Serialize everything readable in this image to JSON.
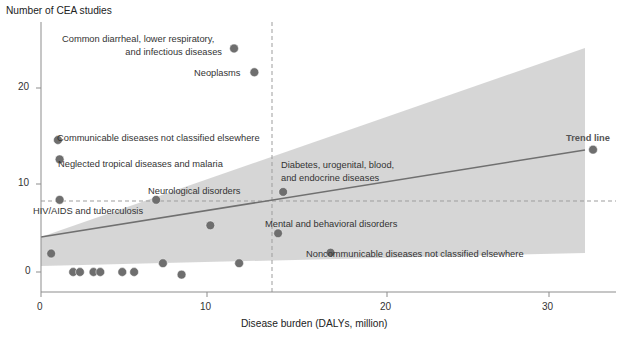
{
  "chart_data": {
    "type": "scatter",
    "title": "",
    "xlabel": "Disease burden (DALYs, million)",
    "ylabel": "Number of CEA studies",
    "xlim": [
      0,
      32.5
    ],
    "ylim": [
      -1.5,
      26.5
    ],
    "xticks": [
      0,
      10,
      20,
      30
    ],
    "yticks": [
      0,
      10,
      20
    ],
    "xtick_labels": [
      "0",
      "10",
      "20",
      "30"
    ],
    "ytick_labels": [
      "0",
      "10",
      "20"
    ],
    "grid": false,
    "legend": "none",
    "marker_color": "#6e6e6e",
    "band_color": "#d3d3d3",
    "trendline_color": "#6e6e6e",
    "reference_lines": {
      "vertical_x": 14.0,
      "horizontal_y": 8.1,
      "style": "dashed",
      "color": "#9a9a9a"
    },
    "trend_line": {
      "label": "Trend line",
      "x": [
        0.0,
        32.7
      ],
      "y": [
        4.0,
        13.9
      ],
      "band_label": "confidence band",
      "band_upper": [
        7.0,
        25.3
      ],
      "band_lower": [
        0.6,
        2.2
      ]
    },
    "points": [
      {
        "label": "Common diarrheal, lower respiratory, and infectious diseases",
        "x": 11.4,
        "y": 25.4,
        "label_pos": "left"
      },
      {
        "label": "Neoplasms",
        "x": 12.6,
        "y": 22.7,
        "label_pos": "left"
      },
      {
        "label": "Communicable diseases not classified elsewhere",
        "x": 1.0,
        "y": 15.0,
        "label_pos": "right"
      },
      {
        "label": "Neglected tropical diseases and malaria",
        "x": 1.1,
        "y": 12.8,
        "label_pos": "right"
      },
      {
        "label": "HIV/AIDS and tuberculosis",
        "x": 1.1,
        "y": 8.2,
        "label_pos": "below"
      },
      {
        "label": "Neurological disorders",
        "x": 6.8,
        "y": 8.2,
        "label_pos": "above"
      },
      {
        "label": "Diabetes, urogenital, blood, and endocrine diseases",
        "x": 14.3,
        "y": 9.1,
        "label_pos": "above"
      },
      {
        "label": "Mental and behavioral disorders",
        "x": 14.0,
        "y": 4.4,
        "label_pos": "above"
      },
      {
        "label": "Noncommunicable diseases not classified elsewhere",
        "x": 17.1,
        "y": 2.2,
        "label_pos": "right"
      },
      {
        "label": "Trend line",
        "x": 32.6,
        "y": 13.9,
        "label_pos": "above"
      },
      {
        "label": "",
        "x": 10.0,
        "y": 5.3,
        "label_pos": "none"
      },
      {
        "label": "",
        "x": 0.6,
        "y": 2.1,
        "label_pos": "none"
      },
      {
        "label": "",
        "x": 7.2,
        "y": 1.0,
        "label_pos": "none"
      },
      {
        "label": "",
        "x": 11.7,
        "y": 1.0,
        "label_pos": "none"
      },
      {
        "label": "",
        "x": 1.9,
        "y": 0.0,
        "label_pos": "none"
      },
      {
        "label": "",
        "x": 2.3,
        "y": 0.0,
        "label_pos": "none"
      },
      {
        "label": "",
        "x": 3.1,
        "y": 0.0,
        "label_pos": "none"
      },
      {
        "label": "",
        "x": 3.5,
        "y": 0.0,
        "label_pos": "none"
      },
      {
        "label": "",
        "x": 4.8,
        "y": 0.0,
        "label_pos": "none"
      },
      {
        "label": "",
        "x": 5.5,
        "y": 0.0,
        "label_pos": "none"
      },
      {
        "label": "",
        "x": 8.3,
        "y": -0.3,
        "label_pos": "none"
      }
    ],
    "annotations": [
      {
        "text": "Common diarrheal, lower respiratory,",
        "x": 11.0,
        "y": 25.8
      },
      {
        "text": "and infectious diseases",
        "x": 11.0,
        "y": 24.4
      },
      {
        "text": "Neoplasms",
        "x": 12.2,
        "y": 22.7
      },
      {
        "text": "Communicable diseases not classified elsewhere",
        "x": 1.4,
        "y": 15.0
      },
      {
        "text": "Neglected tropical diseases and malaria",
        "x": 1.5,
        "y": 12.8
      },
      {
        "text": "Neurological disorders",
        "x": 6.5,
        "y": 9.6
      },
      {
        "text": "HIV/AIDS and tuberculosis",
        "x": 0.8,
        "y": 6.7
      },
      {
        "text": "Diabetes, urogenital, blood,",
        "x": 14.0,
        "y": 11.6
      },
      {
        "text": "and endocrine diseases",
        "x": 14.0,
        "y": 10.3
      },
      {
        "text": "Mental and behavioral disorders",
        "x": 13.7,
        "y": 5.8
      },
      {
        "text": "Noncommunicable diseases not classified elsewhere",
        "x": 17.6,
        "y": 2.2
      },
      {
        "text": "Trend line",
        "x": 32.2,
        "y": 15.3
      }
    ]
  },
  "axis": {
    "y_title": "Number of CEA studies",
    "x_title": "Disease burden (DALYs, million)",
    "y_ticks": [
      "20",
      "10",
      "0"
    ],
    "x_ticks": [
      "0",
      "10",
      "20",
      "30"
    ]
  },
  "labels": {
    "diarrheal_line1": "Common diarrheal, lower respiratory,",
    "diarrheal_line2": "and infectious diseases",
    "neoplasms": "Neoplasms",
    "communicable": "Communicable diseases not classified elsewhere",
    "neglected": "Neglected tropical diseases and malaria",
    "neurological": "Neurological disorders",
    "hiv": "HIV/AIDS and tuberculosis",
    "diabetes_line1": "Diabetes, urogenital, blood,",
    "diabetes_line2": "and endocrine diseases",
    "mental": "Mental and behavioral disorders",
    "noncommunicable": "Noncommunicable diseases not classified elsewhere",
    "trendline": "Trend line"
  }
}
